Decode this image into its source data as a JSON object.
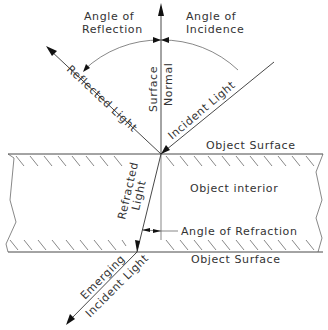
{
  "diagram": {
    "labels": {
      "angle_of_reflection_line1": "Angle of",
      "angle_of_reflection_line2": "Reflection",
      "angle_of_incidence_line1": "Angle of",
      "angle_of_incidence_line2": "Incidence",
      "reflected_light": "Reflected Light",
      "surface": "Surface",
      "normal": "Normal",
      "incident_light": "Incident Light",
      "object_surface_top": "Object Surface",
      "object_interior": "Object interior",
      "refracted_line1": "Refracted",
      "refracted_line2": "Light",
      "angle_of_refraction": "Angle of Refraction",
      "object_surface_bottom": "Object Surface",
      "emerging_line1": "Emerging",
      "emerging_line2": "Incident Light"
    },
    "colors": {
      "line": "#333333",
      "text": "#333333",
      "background": "#ffffff"
    }
  }
}
